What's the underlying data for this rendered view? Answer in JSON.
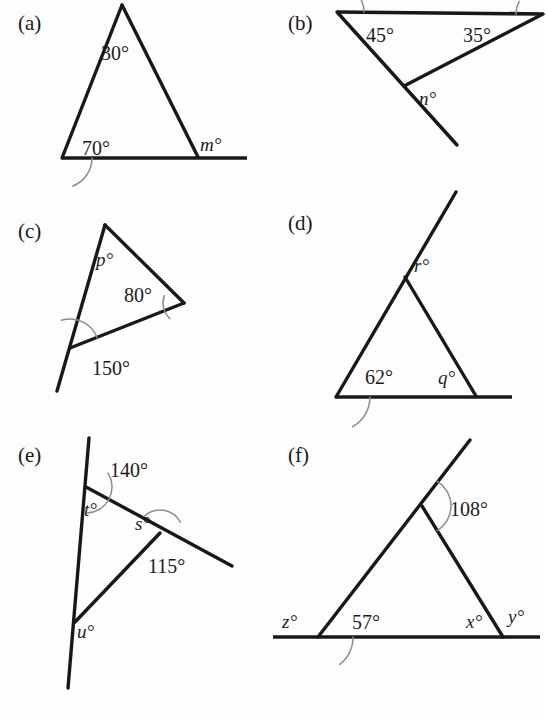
{
  "page": {
    "background_color": "#fdfdfd",
    "line_color": "#17181a",
    "arc_color": "#8c8c8f",
    "width": 546,
    "height": 719,
    "footer_ghost_text": ""
  },
  "parts": [
    {
      "key": "a",
      "label": "(a)",
      "label_pos": [
        18,
        30
      ],
      "description": "Triangle with apex angle 30 degrees, base-left angle 70 degrees, base extended to the right giving exterior angle m degrees at base-right vertex.",
      "vertices": {
        "apex": [
          122,
          5
        ],
        "base_left": [
          62,
          158
        ],
        "base_right": [
          198,
          157
        ],
        "base_extension_end": [
          247,
          158
        ]
      },
      "segments": [
        [
          122,
          5,
          62,
          158
        ],
        [
          122,
          5,
          198,
          157
        ],
        [
          62,
          158,
          247,
          158
        ]
      ],
      "arcs": [
        {
          "cx": 122,
          "cy": 5,
          "r": 34,
          "a0": 68,
          "a1": 112,
          "name": "apex-arc-30"
        },
        {
          "cx": 62,
          "cy": 158,
          "r": 30,
          "a0": 291,
          "a1": 360,
          "name": "base-left-arc-70"
        }
      ],
      "labels": [
        {
          "text": "30°",
          "pos": [
            101,
            60
          ],
          "kind": "number",
          "name": "angle-30"
        },
        {
          "text": "70°",
          "pos": [
            82,
            155
          ],
          "kind": "number",
          "name": "angle-70"
        },
        {
          "text": "m°",
          "pos": [
            200,
            151
          ],
          "kind": "variable",
          "name": "angle-m"
        }
      ]
    },
    {
      "key": "b",
      "label": "(b)",
      "label_pos": [
        288,
        30
      ],
      "description": "Triangle with horizontal top side; angle 45 degrees at top-left vertex, 35 degrees at top-right vertex, and n degrees below the bottom vertex where the left side is produced.",
      "vertices": {
        "top_left": [
          337,
          12
        ],
        "top_right": [
          543,
          14
        ],
        "bottom": [
          404,
          86
        ],
        "extension_end": [
          457,
          145
        ]
      },
      "segments": [
        [
          337,
          12,
          543,
          14
        ],
        [
          337,
          12,
          457,
          145
        ],
        [
          543,
          14,
          404,
          86
        ]
      ],
      "arcs": [
        {
          "cx": 337,
          "cy": 12,
          "r": 27,
          "a0": 0,
          "a1": 48,
          "name": "arc-45"
        },
        {
          "cx": 543,
          "cy": 14,
          "r": 27,
          "a0": 152,
          "a1": 180,
          "name": "arc-35"
        }
      ],
      "labels": [
        {
          "text": "45°",
          "pos": [
            366,
            42
          ],
          "kind": "number",
          "name": "angle-45"
        },
        {
          "text": "35°",
          "pos": [
            463,
            42
          ],
          "kind": "number",
          "name": "angle-35"
        },
        {
          "text": "n°",
          "pos": [
            419,
            105
          ],
          "kind": "variable",
          "name": "angle-n"
        }
      ]
    },
    {
      "key": "c",
      "label": "(c)",
      "label_pos": [
        18,
        238
      ],
      "description": "Triangle with angle p degrees at top vertex, 80 degrees at right vertex, and exterior angle 150 degrees at bottom-left vertex where the left side is produced downward.",
      "vertices": {
        "top": [
          105,
          225
        ],
        "right": [
          184,
          303
        ],
        "bottom_left": [
          70,
          348
        ],
        "extension_end": [
          57,
          391
        ]
      },
      "segments": [
        [
          105,
          225,
          184,
          303
        ],
        [
          184,
          303,
          70,
          348
        ],
        [
          105,
          225,
          57,
          391
        ]
      ],
      "arcs": [
        {
          "cx": 70,
          "cy": 348,
          "r": 29,
          "a0": 21,
          "a1": 107,
          "name": "arc-150"
        },
        {
          "cx": 184,
          "cy": 303,
          "r": 21,
          "a0": 160,
          "a1": 228,
          "name": "arc-80"
        }
      ],
      "labels": [
        {
          "text": "p°",
          "pos": [
            96,
            266
          ],
          "kind": "variable",
          "name": "angle-p"
        },
        {
          "text": "80°",
          "pos": [
            124,
            302
          ],
          "kind": "number",
          "name": "angle-80"
        },
        {
          "text": "150°",
          "pos": [
            92,
            375
          ],
          "kind": "number",
          "name": "angle-150"
        }
      ]
    },
    {
      "key": "d",
      "label": "(d)",
      "label_pos": [
        288,
        230
      ],
      "description": "Isosceles triangle (equal sides marked with single ticks); base angle 62 degrees at bottom-left, q degrees at bottom-right inside, base produced to the right, and r degrees at apex between the produced left side and the right side.",
      "vertices": {
        "apex": [
          405,
          277
        ],
        "base_left": [
          336,
          397
        ],
        "base_right": [
          476,
          396
        ],
        "base_extension_end": [
          512,
          397
        ],
        "ray_end": [
          456,
          192
        ]
      },
      "segments": [
        [
          456,
          192,
          336,
          397
        ],
        [
          405,
          277,
          476,
          396
        ],
        [
          336,
          397,
          512,
          397
        ]
      ],
      "arcs": [
        {
          "cx": 336,
          "cy": 397,
          "r": 34,
          "a0": 299,
          "a1": 360,
          "name": "arc-62"
        }
      ],
      "ticks": [
        {
          "pos": [
            371,
            337
          ],
          "angle": 60,
          "name": "tick-left-side"
        },
        {
          "pos": [
            441,
            337
          ],
          "angle": -60,
          "name": "tick-right-side"
        }
      ],
      "labels": [
        {
          "text": "r°",
          "pos": [
            414,
            272
          ],
          "kind": "variable",
          "name": "angle-r"
        },
        {
          "text": "62°",
          "pos": [
            365,
            384
          ],
          "kind": "number",
          "name": "angle-62"
        },
        {
          "text": "q°",
          "pos": [
            438,
            384
          ],
          "kind": "variable",
          "name": "angle-q"
        }
      ]
    },
    {
      "key": "e",
      "label": "(e)",
      "label_pos": [
        18,
        462
      ],
      "description": "A long near-vertical transversal; 140 degrees above the upper vertex, t degrees below it inside the triangle, s degrees at the middle vertex, 115 degrees below-right of it, and u degrees at the lower vertex.",
      "vertices": {
        "vertical_top": [
          89,
          438
        ],
        "upper": [
          86,
          487
        ],
        "middle": [
          160,
          533
        ],
        "lower": [
          75,
          622
        ],
        "vertical_bottom": [
          68,
          688
        ],
        "slant_end": [
          232,
          566
        ]
      },
      "segments": [
        [
          89,
          438,
          68,
          688
        ],
        [
          86,
          487,
          232,
          566
        ],
        [
          160,
          533,
          75,
          622
        ]
      ],
      "arcs": [
        {
          "cx": 86,
          "cy": 487,
          "r": 26,
          "a0": 273,
          "a1": 32,
          "name": "arc-140"
        },
        {
          "cx": 160,
          "cy": 533,
          "r": 23,
          "a0": 28,
          "a1": 133,
          "name": "arc-115"
        }
      ],
      "labels": [
        {
          "text": "140°",
          "pos": [
            110,
            477
          ],
          "kind": "number",
          "name": "angle-140"
        },
        {
          "text": "t°",
          "pos": [
            84,
            516
          ],
          "kind": "variable",
          "name": "angle-t"
        },
        {
          "text": "s°",
          "pos": [
            135,
            530
          ],
          "kind": "variable",
          "name": "angle-s"
        },
        {
          "text": "115°",
          "pos": [
            148,
            573
          ],
          "kind": "number",
          "name": "angle-115"
        },
        {
          "text": "u°",
          "pos": [
            77,
            638
          ],
          "kind": "variable",
          "name": "angle-u"
        }
      ]
    },
    {
      "key": "f",
      "label": "(f)",
      "label_pos": [
        288,
        462
      ],
      "description": "Triangle standing on a horizontal line; left side produced upward past the apex giving 108 degrees, exterior angle z degrees at bottom-left on the line, interior 57 degrees, interior x degrees at bottom-right and exterior y degrees beyond it.",
      "vertices": {
        "apex": [
          422,
          506
        ],
        "base_left": [
          318,
          637
        ],
        "base_right": [
          503,
          637
        ],
        "ray_end": [
          470,
          440
        ],
        "baseline_start": [
          273,
          637
        ],
        "baseline_end": [
          540,
          637
        ]
      },
      "segments": [
        [
          470,
          440,
          318,
          637
        ],
        [
          422,
          506,
          503,
          637
        ],
        [
          273,
          637,
          540,
          637
        ]
      ],
      "arcs": [
        {
          "cx": 422,
          "cy": 506,
          "r": 29,
          "a0": 302,
          "a1": 58,
          "name": "arc-108"
        },
        {
          "cx": 318,
          "cy": 637,
          "r": 35,
          "a0": 308,
          "a1": 360,
          "name": "arc-57"
        }
      ],
      "labels": [
        {
          "text": "108°",
          "pos": [
            450,
            516
          ],
          "kind": "number",
          "name": "angle-108"
        },
        {
          "text": "z°",
          "pos": [
            282,
            628
          ],
          "kind": "variable",
          "name": "angle-z"
        },
        {
          "text": "57°",
          "pos": [
            352,
            629
          ],
          "kind": "number",
          "name": "angle-57"
        },
        {
          "text": "x°",
          "pos": [
            466,
            628
          ],
          "kind": "variable",
          "name": "angle-x"
        },
        {
          "text": "y°",
          "pos": [
            508,
            623
          ],
          "kind": "variable",
          "name": "angle-y"
        }
      ]
    }
  ]
}
